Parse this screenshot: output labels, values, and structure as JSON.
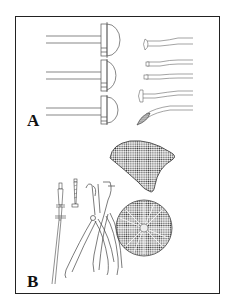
{
  "figure": {
    "panels": [
      {
        "id": "A",
        "label": "A",
        "description": "Three hemispherical instruments with long handles (left) and five angled probe/burnisher instruments (right)"
      },
      {
        "id": "B",
        "label": "B",
        "description": "Long instrument, screw, two pliers/forceps, triangular mesh plate and circular mesh disc"
      }
    ],
    "colors": {
      "border": "#222222",
      "line": "#555555",
      "mesh": "#444444",
      "background": "#ffffff"
    }
  }
}
